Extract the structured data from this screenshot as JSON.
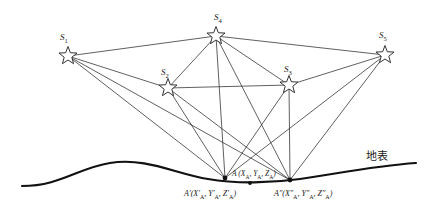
{
  "figure": {
    "background_color": "#ffffff",
    "line_color": "#2b2b2b",
    "terrain_color": "#111111",
    "canvas": {
      "width": 438,
      "height": 219
    }
  },
  "stations": [
    {
      "id": "S1",
      "label": "S",
      "subscript": "1",
      "x": 68,
      "y": 56,
      "label_x": 60,
      "label_y": 33
    },
    {
      "id": "S2",
      "label": "S",
      "subscript": "2",
      "x": 168,
      "y": 88,
      "label_x": 161,
      "label_y": 68
    },
    {
      "id": "S3",
      "label": "S",
      "subscript": "3",
      "x": 289,
      "y": 85,
      "label_x": 284,
      "label_y": 65
    },
    {
      "id": "S4",
      "label": "S",
      "subscript": "4",
      "x": 216,
      "y": 36,
      "label_x": 214,
      "label_y": 13
    },
    {
      "id": "S5",
      "label": "S",
      "subscript": "5",
      "x": 385,
      "y": 55,
      "label_x": 379,
      "label_y": 31
    }
  ],
  "ground_points": [
    {
      "id": "A_prime",
      "x": 225,
      "y": 178,
      "label": "A′(X′",
      "sub1": "A",
      "mid1": ", Y′",
      "sub2": "A",
      "mid2": ", Z′",
      "sub3": "A",
      "tail": ")",
      "label_x": 184,
      "label_y": 190
    },
    {
      "id": "A_double_prime",
      "x": 290,
      "y": 180,
      "label": "A″(X″",
      "sub1": "A",
      "mid1": ", Y″",
      "sub2": "A",
      "mid2": ", Z″",
      "sub3": "A",
      "tail": ")",
      "label_x": 274,
      "label_y": 190
    },
    {
      "id": "A_point",
      "x": 250,
      "y": 183,
      "label": "A (X",
      "sub1": "A",
      "mid1": ", Y",
      "sub2": "A",
      "mid2": ", Z",
      "sub3": "A",
      "tail": ")",
      "label_x": 232,
      "label_y": 170
    }
  ],
  "annotations": {
    "ground_surface": "地表",
    "ground_surface_x": 366,
    "ground_surface_y": 151
  },
  "terrain": {
    "path": "M 22 186 C 60 186 78 168 110 163 C 146 157 176 174 208 179 C 236 184 272 183 300 179 C 336 174 372 166 416 163",
    "stroke_width": 2.1
  },
  "edges": [
    {
      "from": "S1",
      "to": "S4"
    },
    {
      "from": "S1",
      "to": "S2"
    },
    {
      "from": "S1",
      "to": "A_prime"
    },
    {
      "from": "S1",
      "to": "A_double_prime"
    },
    {
      "from": "S4",
      "to": "S5"
    },
    {
      "from": "S4",
      "to": "S2"
    },
    {
      "from": "S4",
      "to": "S3"
    },
    {
      "from": "S4",
      "to": "A_prime"
    },
    {
      "from": "S4",
      "to": "A_double_prime"
    },
    {
      "from": "S5",
      "to": "S3"
    },
    {
      "from": "S5",
      "to": "A_prime"
    },
    {
      "from": "S5",
      "to": "A_double_prime"
    },
    {
      "from": "S2",
      "to": "S3"
    },
    {
      "from": "S2",
      "to": "A_prime"
    },
    {
      "from": "S2",
      "to": "A_double_prime"
    },
    {
      "from": "S3",
      "to": "A_prime"
    },
    {
      "from": "S3",
      "to": "A_double_prime"
    }
  ]
}
